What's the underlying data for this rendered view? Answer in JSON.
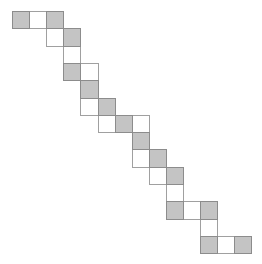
{
  "diagram": {
    "grid": {
      "origin_x": 12,
      "origin_y": 11,
      "cell_w": 17.1,
      "cell_h": 17.3,
      "cols": 14,
      "rows": 14
    },
    "colors": {
      "filled": "#c4c4c4",
      "empty": "#ffffff",
      "border": "#8c8c8c"
    },
    "cells": [
      {
        "row": 0,
        "col": 0,
        "fill": "gray"
      },
      {
        "row": 0,
        "col": 1,
        "fill": "white"
      },
      {
        "row": 0,
        "col": 2,
        "fill": "gray"
      },
      {
        "row": 1,
        "col": 2,
        "fill": "white"
      },
      {
        "row": 1,
        "col": 3,
        "fill": "gray"
      },
      {
        "row": 2,
        "col": 3,
        "fill": "white"
      },
      {
        "row": 3,
        "col": 3,
        "fill": "gray"
      },
      {
        "row": 3,
        "col": 4,
        "fill": "white"
      },
      {
        "row": 4,
        "col": 4,
        "fill": "gray"
      },
      {
        "row": 5,
        "col": 4,
        "fill": "white"
      },
      {
        "row": 5,
        "col": 5,
        "fill": "gray"
      },
      {
        "row": 6,
        "col": 5,
        "fill": "white"
      },
      {
        "row": 6,
        "col": 6,
        "fill": "gray"
      },
      {
        "row": 6,
        "col": 7,
        "fill": "white"
      },
      {
        "row": 7,
        "col": 7,
        "fill": "gray"
      },
      {
        "row": 8,
        "col": 7,
        "fill": "white"
      },
      {
        "row": 8,
        "col": 8,
        "fill": "gray"
      },
      {
        "row": 9,
        "col": 8,
        "fill": "white"
      },
      {
        "row": 9,
        "col": 9,
        "fill": "gray"
      },
      {
        "row": 10,
        "col": 9,
        "fill": "white"
      },
      {
        "row": 11,
        "col": 9,
        "fill": "gray"
      },
      {
        "row": 11,
        "col": 10,
        "fill": "white"
      },
      {
        "row": 11,
        "col": 11,
        "fill": "gray"
      },
      {
        "row": 12,
        "col": 11,
        "fill": "white"
      },
      {
        "row": 13,
        "col": 11,
        "fill": "gray"
      },
      {
        "row": 13,
        "col": 12,
        "fill": "white"
      },
      {
        "row": 13,
        "col": 13,
        "fill": "gray"
      }
    ]
  }
}
